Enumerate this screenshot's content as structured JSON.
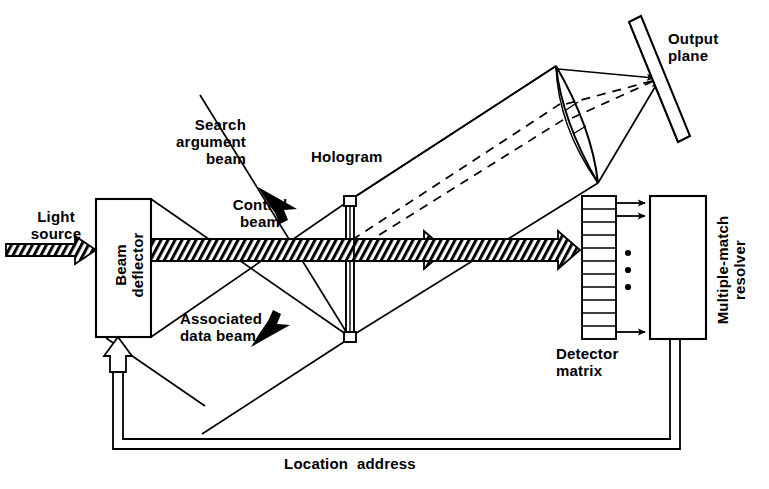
{
  "figure": {
    "stroke_color": "#000000",
    "background": "#ffffff"
  },
  "labels": {
    "light_source": "Light\nsource",
    "beam_deflector": "Beam\ndeflector",
    "search_argument_beam": "Search\nargument\nbeam",
    "control_beam": "Control\nbeam",
    "associated_data_beam": "Associated\ndata beam",
    "hologram": "Hologram",
    "output_plane": "Output\nplane",
    "detector_matrix": "Detector\nmatrix",
    "multiple_match_resolver": "Multiple-match\nresolver",
    "location_address": "Location  address"
  },
  "components": {
    "beam_deflector": {
      "name": "Beam deflector",
      "shape": "rectangle"
    },
    "hologram": {
      "name": "Hologram",
      "shape": "vertical-plate"
    },
    "lens": {
      "name": "Lens",
      "shape": "lenticular"
    },
    "output_plane": {
      "name": "Output plane",
      "shape": "tilted-plate"
    },
    "detector_matrix": {
      "name": "Detector matrix",
      "shape": "cell-column",
      "cells": 11
    },
    "multiple_match_resolver": {
      "name": "Multiple-match resolver",
      "shape": "rectangle"
    }
  },
  "beams": {
    "light_source_beam": {
      "style": "hatched-arrow",
      "direction": "right"
    },
    "control_beam": {
      "style": "hatched-arrow",
      "direction": "right"
    },
    "search_argument_beam": {
      "style": "solid-line",
      "direction": "down-right"
    },
    "associated_data_beam": {
      "style": "solid-line",
      "direction": "up-right"
    },
    "diffracted_rays": {
      "style": "dashed-line",
      "count": 2
    },
    "feedback_bus": {
      "style": "double-line",
      "arrow": "open-arrow-up"
    },
    "detector_outputs": {
      "style": "solid-arrows",
      "count": 3
    }
  },
  "annotations": {
    "ellipsis_dots": 3,
    "pointer_arrows": [
      "search-argument-pointer",
      "associated-data-pointer"
    ]
  }
}
